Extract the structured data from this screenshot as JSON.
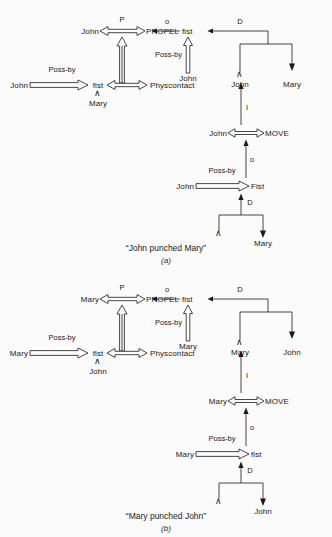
{
  "document": {
    "type": "conceptual-dependency-diagram",
    "background_color": "#fbfbfb",
    "ink_color": "#1a1a1a"
  },
  "figures": [
    {
      "id": "a",
      "caption": "“John punched Mary”",
      "sublabel": "(a)",
      "actor": "John",
      "patient": "Mary",
      "nodes": {
        "actor_propel": "John",
        "act_propel": "PROPEL",
        "object_fist_top": "fist",
        "actor_possby_left": "John",
        "fist_mid": "fist",
        "state_physcontact": "Physcontact",
        "fist_owner": "Mary",
        "possby_vertical_actor": "John",
        "d_from": "John",
        "d_to": "Mary",
        "actor_move": "John",
        "act_move": "MOVE",
        "object_fist_lower": "Fist",
        "actor_possby_lower": "John",
        "d_lower_to": "Mary"
      },
      "link_labels": {
        "propel_p": "P",
        "object_o_top": "o",
        "possby_top": "Poss-by",
        "possby_left": "Poss-by",
        "direction_d_top": "D",
        "instrument_i": "I",
        "move_object_o": "o",
        "possby_lower": "Poss-by",
        "direction_d_lower": "D"
      }
    },
    {
      "id": "b",
      "caption": "“Mary punched John”",
      "sublabel": "(b)",
      "actor": "Mary",
      "patient": "John",
      "nodes": {
        "actor_propel": "Mary",
        "act_propel": "PROPEL",
        "object_fist_top": "fist",
        "actor_possby_left": "Mary",
        "fist_mid": "fist",
        "state_physcontact": "Physcontact",
        "fist_owner": "John",
        "possby_vertical_actor": "Mary",
        "d_from": "Mary",
        "d_to": "John",
        "actor_move": "Mary",
        "act_move": "MOVE",
        "object_fist_lower": "fist",
        "actor_possby_lower": "Mary",
        "d_lower_to": "John"
      },
      "link_labels": {
        "propel_p": "P",
        "object_o_top": "o",
        "possby_top": "Poss-by",
        "possby_left": "Poss-by",
        "direction_d_top": "D",
        "instrument_i": "I",
        "move_object_o": "o",
        "possby_lower": "Poss-by",
        "direction_d_lower": "D"
      }
    }
  ],
  "glyphs": {
    "wedge": "∧"
  }
}
